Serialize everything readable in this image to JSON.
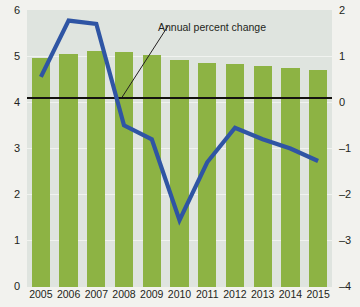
{
  "chart_data": {
    "type": "bar",
    "title": "",
    "subtitle": "",
    "xlabel": "",
    "ylabel": "",
    "categories": [
      "2005",
      "2006",
      "2007",
      "2008",
      "2009",
      "2010",
      "2011",
      "2012",
      "2013",
      "2014",
      "2015"
    ],
    "series": [
      {
        "name": "Bars (left axis)",
        "type": "bar",
        "axis": "left",
        "color": "#8db344",
        "values": [
          4.95,
          5.05,
          5.12,
          5.09,
          5.02,
          4.92,
          4.86,
          4.82,
          4.79,
          4.75,
          4.69
        ]
      },
      {
        "name": "Annual percent change",
        "type": "line",
        "axis": "right",
        "color": "#2f55a4",
        "values": [
          0.55,
          1.77,
          1.7,
          -0.5,
          -0.8,
          -2.55,
          -1.3,
          -0.55,
          -0.8,
          -1.0,
          -1.27
        ]
      }
    ],
    "left_axis": {
      "ticks": [
        "0",
        "1",
        "2",
        "3",
        "4",
        "5",
        "6"
      ],
      "min": 0,
      "max": 6
    },
    "right_axis": {
      "ticks": [
        "2",
        "1",
        "0",
        "–1",
        "–2",
        "–3",
        "–4"
      ],
      "min": -4,
      "max": 2
    },
    "zero_reference_line": {
      "value": 0,
      "axis": "right",
      "color": "#14120f"
    },
    "grid": true,
    "legend_position": "annotation-inline",
    "annotations": [
      {
        "text": "Annual percent change",
        "target_year": "2008",
        "color": "#231f20"
      }
    ],
    "colors": {
      "bar": "#8db344",
      "line": "#2f55a4",
      "plot_background": "#dfe4df",
      "page_background": "#f2f2ee",
      "axis_text": "#231f20",
      "gridline": "#f4f6f3"
    }
  }
}
